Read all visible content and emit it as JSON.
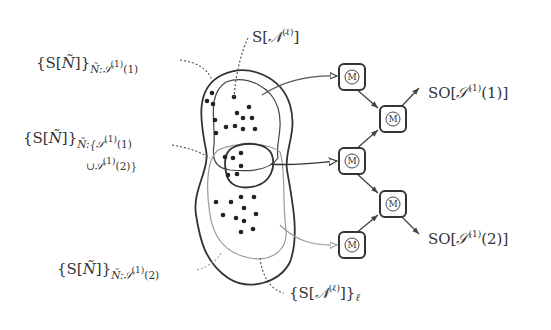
{
  "labels": {
    "top": {
      "base": "S[",
      "cal": "𝒩",
      "sup": "(ℓ)",
      "close": "]"
    },
    "upper_left": {
      "base": "{S[",
      "cal": "Ñ",
      "close": "]}",
      "sub_pre": "Ñ:",
      "sub_cal": "𝒮",
      "sub_sup": "(1)",
      "sub_post": "(1)"
    },
    "middle_left": {
      "base": "{S[",
      "cal": "Ñ",
      "close": "]}",
      "sub_line1_pre": "Ñ:{",
      "sub_line1_cal": "𝒮",
      "sub_line1_sup": "(1)",
      "sub_line1_post": "(1)",
      "sub_line2_pre": "∪",
      "sub_line2_cal": "𝒮",
      "sub_line2_sup": "(1)",
      "sub_line2_post": "(2)}"
    },
    "lower_left": {
      "base": "{S[",
      "cal": "Ñ",
      "close": "]}",
      "sub_pre": "Ñ:",
      "sub_cal": "𝒮",
      "sub_sup": "(1)",
      "sub_post": "(2)"
    },
    "bottom": {
      "base": "{S[",
      "cal": "𝒩",
      "sup": "(ℓ)",
      "close": "]}",
      "sub": "ℓ"
    },
    "output_1": {
      "base": "SO[",
      "cal": "𝒮",
      "sup": "(1)",
      "post": "(1)]"
    },
    "output_2": {
      "base": "SO[",
      "cal": "𝒮",
      "sup": "(1)",
      "post": "(2)]"
    }
  },
  "nodes": [
    {
      "id": "m1",
      "symbol": "M"
    },
    {
      "id": "m2",
      "symbol": "M"
    },
    {
      "id": "m3",
      "symbol": "M"
    },
    {
      "id": "m4",
      "symbol": "M"
    },
    {
      "id": "m5",
      "symbol": "M"
    }
  ],
  "colors": {
    "ink": "#333333",
    "light_contour": "#9a9a9a",
    "dashed_leader": "#555555"
  }
}
